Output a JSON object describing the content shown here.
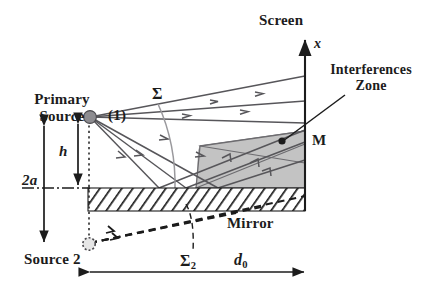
{
  "figure": {
    "type": "optics-ray-diagram"
  },
  "labels": {
    "primary_source_line1": "Primary",
    "primary_source_line2": "Source",
    "source_index": "(1)",
    "source2": "Source 2",
    "screen": "Screen",
    "axis_x": "x",
    "interferences_line1": "Interferences",
    "interferences_line2": "Zone",
    "point_m": "M",
    "mirror": "Mirror",
    "sigma": "Σ",
    "sigma2_base": "Σ",
    "sigma2_sub": "2",
    "dim_2a": "2a",
    "dim_h": "h",
    "dim_d0_base": "d",
    "dim_d0_sub": "0"
  },
  "colors": {
    "ink": "#1c1c1c",
    "ray": "#57565a",
    "ray_light": "#8f8e92",
    "zone_fill": "#c3c3c3",
    "zone_stroke": "#6d6c70",
    "source_fill": "#8d8c90",
    "background": "#ffffff",
    "hatch": "#1c1c1c"
  },
  "geometry": {
    "source1": {
      "x": 90,
      "y": 117
    },
    "source2": {
      "x": 88,
      "y": 244
    },
    "mirror_plane_y": 188,
    "mirror_block": {
      "x0": 88,
      "y0": 188,
      "x1": 305,
      "y1": 211
    },
    "screen_x": 305,
    "screen_top_y": 37,
    "screen_bottom_y": 211,
    "point_m": {
      "x": 281,
      "y": 140
    },
    "d0_arrow_y": 272,
    "dim_2a_x": 44,
    "dim_h_x": 77
  },
  "rays_from_source1": [
    {
      "x2": 305,
      "y2": 76,
      "arrow_t": 0.62
    },
    {
      "x2": 305,
      "y2": 101,
      "arrow_t": 0.58
    },
    {
      "x2": 305,
      "y2": 123,
      "arrow_t": 0.52
    },
    {
      "x2": 215,
      "y2": 188,
      "arrow_t": 0.55
    },
    {
      "x2": 185,
      "y2": 188,
      "arrow_t": 0.55
    },
    {
      "x2": 158,
      "y2": 188,
      "arrow_t": 0.58
    }
  ],
  "reflected_rays": [
    {
      "x1": 158,
      "y1": 188,
      "x2": 305,
      "y2": 130
    },
    {
      "x1": 185,
      "y1": 188,
      "x2": 305,
      "y2": 144
    },
    {
      "x1": 215,
      "y1": 188,
      "x2": 305,
      "y2": 163
    }
  ],
  "virtual_rays_from_source2": [
    {
      "x2": 305,
      "y2": 196
    },
    {
      "x2": 262,
      "y2": 205
    },
    {
      "x2": 232,
      "y2": 212
    }
  ]
}
